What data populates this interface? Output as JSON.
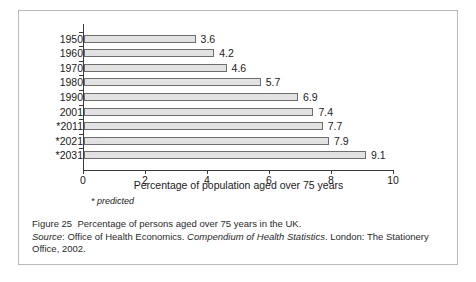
{
  "chart_data": {
    "type": "bar",
    "orientation": "horizontal",
    "title": "",
    "xlabel": "Percentage of population aged over 75 years",
    "ylabel": "",
    "categories": [
      "1950",
      "1960",
      "1970",
      "1980",
      "1990",
      "2001",
      "*2011",
      "*2021",
      "*2031"
    ],
    "values": [
      3.6,
      4.2,
      4.6,
      5.7,
      6.9,
      7.4,
      7.7,
      7.9,
      9.1
    ],
    "value_labels": [
      "3.6",
      "4.2",
      "4.6",
      "5.7",
      "6.9",
      "7.4",
      "7.7",
      "7.9",
      "9.1"
    ],
    "xlim": [
      0,
      10
    ],
    "xticks": [
      0,
      2,
      4,
      6,
      8,
      10
    ],
    "xtick_labels": [
      "0",
      "2",
      "4",
      "6",
      "8",
      "10"
    ],
    "grid": false,
    "legend": "none",
    "bar_fill_color": "#e2e2e2",
    "bar_border_color": "#6e6e6e",
    "annotation": "* predicted"
  },
  "caption": {
    "figure_label": "Figure 25",
    "figure_text": "Percentage of persons aged over 75 years in the UK.",
    "source_label": "Source",
    "source_publisher": ": Office of Health Economics.",
    "source_title": "Compendium of Health Statistics",
    "source_rest": ". London: The Stationery",
    "source_line2": "Office, 2002."
  }
}
